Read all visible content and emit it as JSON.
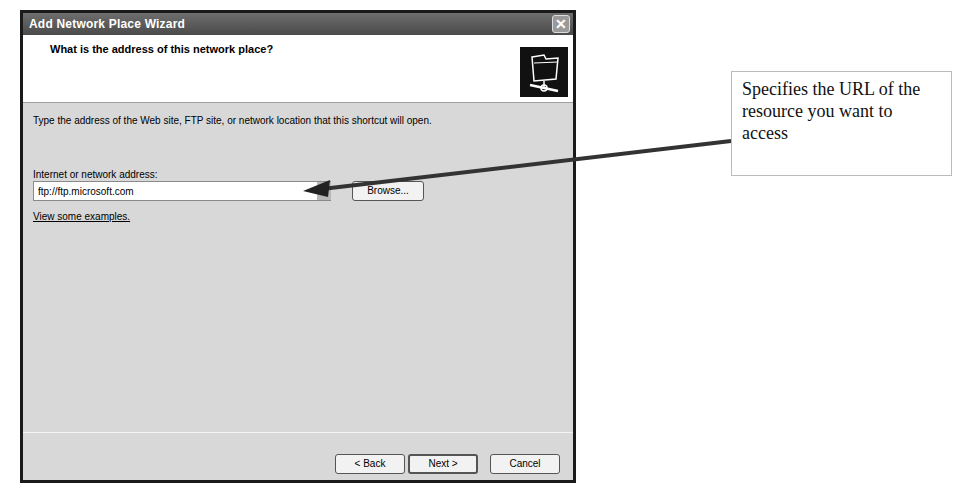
{
  "dialog": {
    "title": "Add Network Place Wizard",
    "close_label": "✕",
    "header_title": "What is the address of this network place?",
    "header_icon": "network-folder-icon",
    "description": "Type the address of the Web site, FTP site, or network location that this shortcut will open.",
    "address_label": "Internet or network address:",
    "address_value": "ftp://ftp.microsoft.com",
    "browse_label": "Browse...",
    "examples_link": "View some examples.",
    "buttons": {
      "back": "< Back",
      "next": "Next >",
      "cancel": "Cancel"
    }
  },
  "annotation": {
    "callout_text": "Specifies the URL of the resource you want to access",
    "arrow_color": "#333333"
  }
}
